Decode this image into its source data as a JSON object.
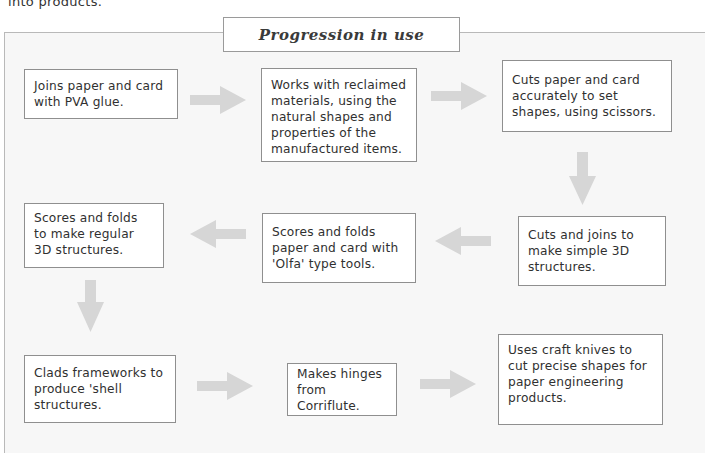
{
  "intro_text": "into products.",
  "title": "Progression in use",
  "steps": [
    {
      "id": 1,
      "text": "Joins paper and card with PVA glue."
    },
    {
      "id": 2,
      "text": "Works with reclaimed materials, using the natural shapes and properties of the manufactured items."
    },
    {
      "id": 3,
      "text": "Cuts paper and card accurately to set shapes, using scissors."
    },
    {
      "id": 4,
      "text": "Cuts and joins to make simple 3D structures."
    },
    {
      "id": 5,
      "text": "Scores and folds paper and card with 'Olfa' type tools."
    },
    {
      "id": 6,
      "text": "Scores and folds to make regular 3D structures."
    },
    {
      "id": 7,
      "text": "Clads frameworks to produce 'shell structures."
    },
    {
      "id": 8,
      "text": "Makes hinges from Corriflute."
    },
    {
      "id": 9,
      "text": "Uses craft knives to cut precise shapes for paper engineering products."
    }
  ],
  "arrows": [
    {
      "from": 1,
      "to": 2,
      "direction": "right"
    },
    {
      "from": 2,
      "to": 3,
      "direction": "right"
    },
    {
      "from": 3,
      "to": 4,
      "direction": "down"
    },
    {
      "from": 4,
      "to": 5,
      "direction": "left"
    },
    {
      "from": 5,
      "to": 6,
      "direction": "left"
    },
    {
      "from": 6,
      "to": 7,
      "direction": "down"
    },
    {
      "from": 7,
      "to": 8,
      "direction": "right"
    },
    {
      "from": 8,
      "to": 9,
      "direction": "right"
    }
  ],
  "colors": {
    "frame_border": "#b9b9b9",
    "frame_fill": "#f7f7f7",
    "box_border": "#8f8f8f",
    "arrow": "#d6d6d6"
  }
}
